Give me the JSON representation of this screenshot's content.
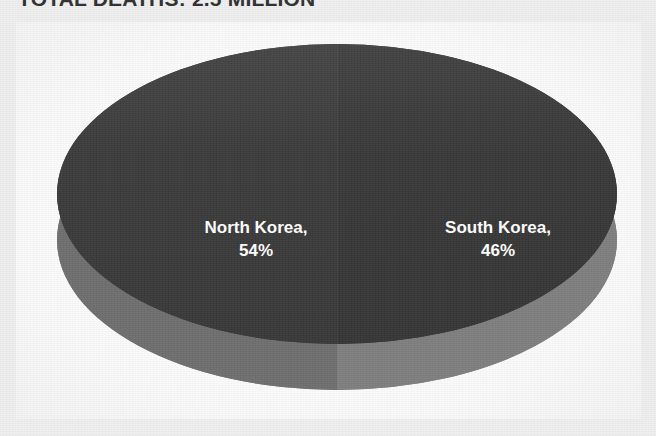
{
  "headline": {
    "text": "TOTAL DEATHS: 2.5 MILLION"
  },
  "colors": {
    "page_background": "#eeeeee",
    "panel_background": "#fdfdfd",
    "pie_top": "#3a3a3a",
    "pie_side": "#7f7f7f",
    "label_text": "#ffffff",
    "headline_text": "#242424"
  },
  "chart_data": {
    "type": "pie",
    "title": "TOTAL DEATHS: 2.5 MILLION",
    "subtitle": "",
    "xlabel": "",
    "ylabel": "",
    "categories": [
      "North Korea",
      "South Korea"
    ],
    "values": [
      54,
      46
    ],
    "value_unit": "%",
    "labels": [
      {
        "name": "North Korea",
        "value": 54,
        "text_line1": "North Korea,",
        "text_line2": "54%",
        "color": "#3b3b3b"
      },
      {
        "name": "South Korea",
        "value": 46,
        "text_line1": "South Korea,",
        "text_line2": "46%",
        "color": "#383838"
      }
    ],
    "legend": [],
    "legend_position": "none",
    "grid": false,
    "three_d": true,
    "data_labels_inside": true
  }
}
